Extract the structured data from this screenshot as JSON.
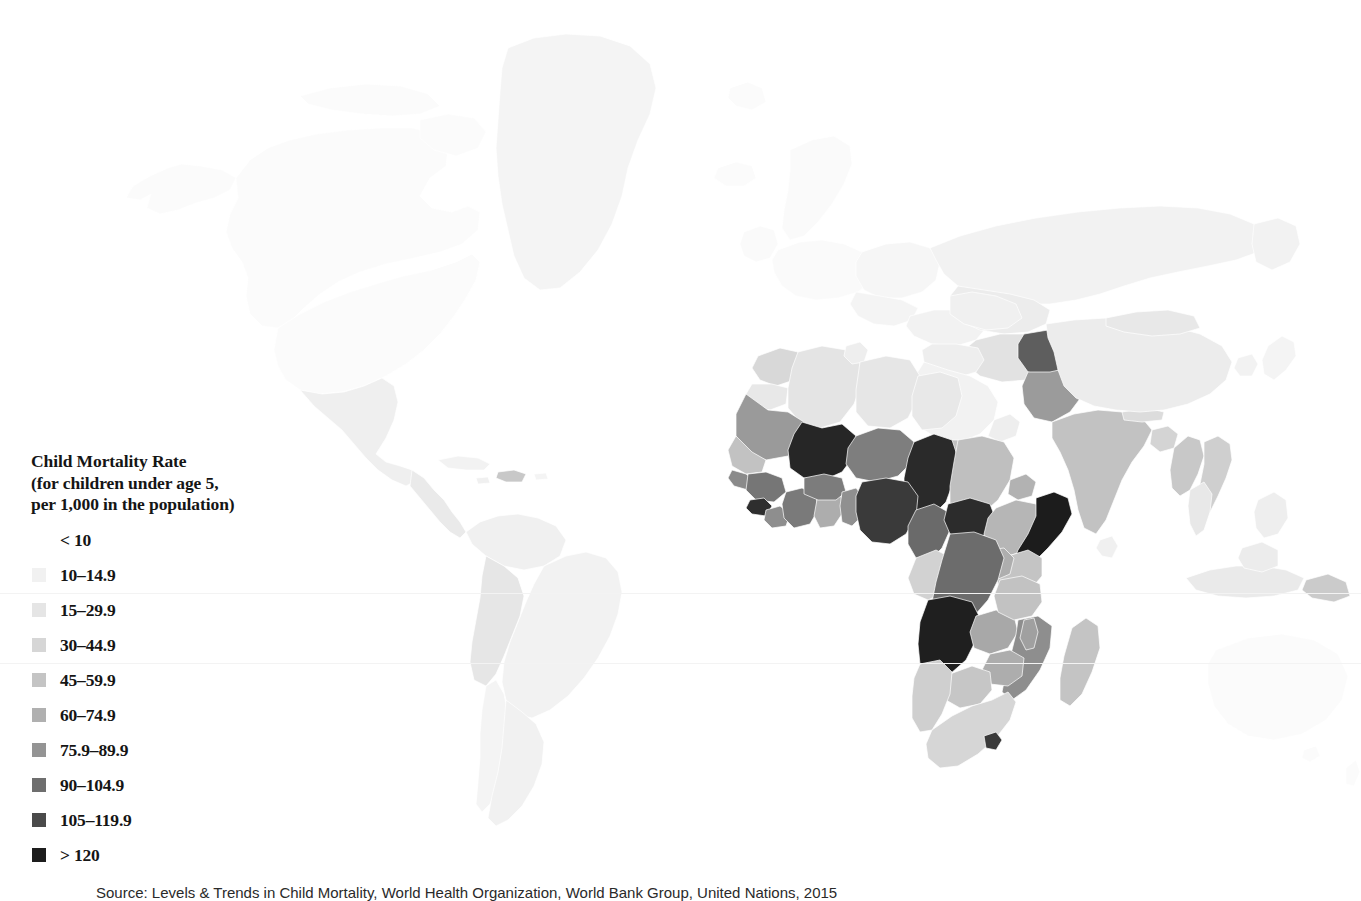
{
  "figure": {
    "kind": "choropleth-world-map",
    "background_color": "#ffffff",
    "no_data_color": "#fbfbfb",
    "border_color": "#ffffff"
  },
  "legend": {
    "title": "Child Mortality Rate\n(for children under age 5,\nper 1,000 in the population)",
    "title_line_1": "Child Mortality Rate",
    "title_line_2": "(for children under age 5,",
    "title_line_3": "per 1,000 in the population)",
    "items": [
      {
        "label": "< 10",
        "color": "#ffffff",
        "has_swatch": false
      },
      {
        "label": "10–14.9",
        "color": "#f1f1f1",
        "has_swatch": true
      },
      {
        "label": "15–29.9",
        "color": "#e5e5e5",
        "has_swatch": true
      },
      {
        "label": "30–44.9",
        "color": "#d6d6d6",
        "has_swatch": true
      },
      {
        "label": "45–59.9",
        "color": "#c4c4c4",
        "has_swatch": true
      },
      {
        "label": "60–74.9",
        "color": "#b0b0b0",
        "has_swatch": true
      },
      {
        "label": "75.9–89.9",
        "color": "#949494",
        "has_swatch": true
      },
      {
        "label": "90–104.9",
        "color": "#6e6e6e",
        "has_swatch": true
      },
      {
        "label": "105–119.9",
        "color": "#4a4a4a",
        "has_swatch": true
      },
      {
        "label": "> 120",
        "color": "#1d1d1d",
        "has_swatch": true
      }
    ]
  },
  "source": {
    "caption": "Source: Levels & Trends in Child Mortality, World Health Organization, World Bank Group, United Nations, 2015"
  },
  "chart_data": {
    "type": "heatmap",
    "title": "Child Mortality Rate (for children under age 5, per 1,000 in the population)",
    "legend_position": "left",
    "bins": [
      "< 10",
      "10–14.9",
      "15–29.9",
      "30–44.9",
      "45–59.9",
      "60–74.9",
      "75.9–89.9",
      "90–104.9",
      "105–119.9",
      "> 120"
    ],
    "bin_colors": [
      "#ffffff",
      "#f1f1f1",
      "#e5e5e5",
      "#d6d6d6",
      "#c4c4c4",
      "#b0b0b0",
      "#949494",
      "#6e6e6e",
      "#4a4a4a",
      "#1d1d1d"
    ],
    "regions": [
      {
        "name": "Canada",
        "bin": "< 10"
      },
      {
        "name": "United States",
        "bin": "< 10"
      },
      {
        "name": "Greenland",
        "bin": "< 10"
      },
      {
        "name": "Mexico",
        "bin": "10–14.9"
      },
      {
        "name": "Guatemala",
        "bin": "30–44.9"
      },
      {
        "name": "Haiti",
        "bin": "60–74.9"
      },
      {
        "name": "Brazil",
        "bin": "10–14.9"
      },
      {
        "name": "Bolivia",
        "bin": "30–44.9"
      },
      {
        "name": "Argentina",
        "bin": "10–14.9"
      },
      {
        "name": "Western Europe",
        "bin": "< 10"
      },
      {
        "name": "Russia",
        "bin": "10–14.9"
      },
      {
        "name": "Morocco",
        "bin": "30–44.9"
      },
      {
        "name": "Algeria",
        "bin": "15–29.9"
      },
      {
        "name": "Libya",
        "bin": "15–29.9"
      },
      {
        "name": "Egypt",
        "bin": "15–29.9"
      },
      {
        "name": "Mauritania",
        "bin": "75.9–89.9"
      },
      {
        "name": "Mali",
        "bin": "> 120"
      },
      {
        "name": "Niger",
        "bin": "90–104.9"
      },
      {
        "name": "Chad",
        "bin": "> 120"
      },
      {
        "name": "Sudan",
        "bin": "60–74.9"
      },
      {
        "name": "Senegal",
        "bin": "45–59.9"
      },
      {
        "name": "Guinea",
        "bin": "90–104.9"
      },
      {
        "name": "Sierra Leone",
        "bin": "> 120"
      },
      {
        "name": "Liberia",
        "bin": "75.9–89.9"
      },
      {
        "name": "Cote d'Ivoire",
        "bin": "90–104.9"
      },
      {
        "name": "Ghana",
        "bin": "60–74.9"
      },
      {
        "name": "Burkina Faso",
        "bin": "90–104.9"
      },
      {
        "name": "Nigeria",
        "bin": "105–119.9"
      },
      {
        "name": "Cameroon",
        "bin": "90–104.9"
      },
      {
        "name": "Central African Republic",
        "bin": "> 120"
      },
      {
        "name": "South Sudan",
        "bin": "90–104.9"
      },
      {
        "name": "Ethiopia",
        "bin": "60–74.9"
      },
      {
        "name": "Somalia",
        "bin": "> 120"
      },
      {
        "name": "Kenya",
        "bin": "45–59.9"
      },
      {
        "name": "Uganda",
        "bin": "60–74.9"
      },
      {
        "name": "Democratic Republic of the Congo",
        "bin": "90–104.9"
      },
      {
        "name": "Angola",
        "bin": "> 120"
      },
      {
        "name": "Zambia",
        "bin": "60–74.9"
      },
      {
        "name": "Mozambique",
        "bin": "75.9–89.9"
      },
      {
        "name": "Zimbabwe",
        "bin": "60–74.9"
      },
      {
        "name": "Botswana",
        "bin": "45–59.9"
      },
      {
        "name": "South Africa",
        "bin": "30–44.9"
      },
      {
        "name": "Madagascar",
        "bin": "45–59.9"
      },
      {
        "name": "Tanzania",
        "bin": "45–59.9"
      },
      {
        "name": "Saudi Arabia",
        "bin": "10–14.9"
      },
      {
        "name": "Yemen",
        "bin": "45–59.9"
      },
      {
        "name": "Iran",
        "bin": "15–29.9"
      },
      {
        "name": "Afghanistan",
        "bin": "90–104.9"
      },
      {
        "name": "Pakistan",
        "bin": "75.9–89.9"
      },
      {
        "name": "India",
        "bin": "45–59.9"
      },
      {
        "name": "Nepal",
        "bin": "30–44.9"
      },
      {
        "name": "Bangladesh",
        "bin": "30–44.9"
      },
      {
        "name": "Myanmar",
        "bin": "45–59.9"
      },
      {
        "name": "Laos",
        "bin": "60–74.9"
      },
      {
        "name": "China",
        "bin": "10–14.9"
      },
      {
        "name": "Mongolia",
        "bin": "15–29.9"
      },
      {
        "name": "Indonesia",
        "bin": "15–29.9"
      },
      {
        "name": "Australia",
        "bin": "< 10"
      },
      {
        "name": "Papua New Guinea",
        "bin": "45–59.9"
      }
    ]
  }
}
